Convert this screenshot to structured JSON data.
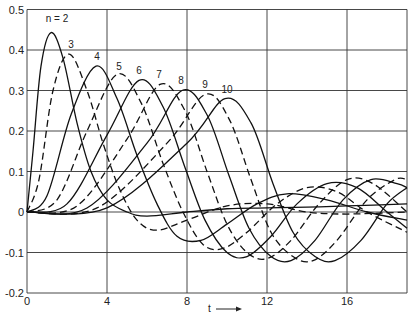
{
  "chart_data": {
    "type": "line",
    "title": "",
    "xlabel": "t",
    "ylabel": "",
    "xlim": [
      0,
      19
    ],
    "ylim": [
      -0.2,
      0.5
    ],
    "x_ticks": [
      "0",
      "4",
      "8",
      "12",
      "16"
    ],
    "y_ticks": [
      "0.5",
      "0.4",
      "0.3",
      "0.2",
      "0.1",
      "0",
      "-0.1",
      "-0.2"
    ],
    "grid": true,
    "legend_position": "inline labels above peaks",
    "series": [
      {
        "name": "n = 2",
        "label": "n = 2",
        "dash": false,
        "points": [
          [
            0,
            0
          ],
          [
            0.3,
            0.15
          ],
          [
            0.7,
            0.36
          ],
          [
            1.2,
            0.443
          ],
          [
            1.8,
            0.38
          ],
          [
            2.5,
            0.22
          ],
          [
            3.2,
            0.1
          ],
          [
            4,
            0.03
          ],
          [
            5,
            0.0
          ],
          [
            6,
            -0.01
          ],
          [
            8,
            0.0
          ],
          [
            10,
            0.008
          ],
          [
            12,
            0.01
          ],
          [
            14,
            0.012
          ],
          [
            16,
            0.015
          ],
          [
            19,
            0.02
          ]
        ]
      },
      {
        "name": "n = 3",
        "label": "3",
        "dash": true,
        "points": [
          [
            0,
            0
          ],
          [
            0.6,
            0.08
          ],
          [
            1.3,
            0.3
          ],
          [
            2.1,
            0.39
          ],
          [
            3,
            0.3
          ],
          [
            3.8,
            0.17
          ],
          [
            4.6,
            0.06
          ],
          [
            5.5,
            -0.02
          ],
          [
            6.5,
            -0.045
          ],
          [
            8,
            -0.02
          ],
          [
            10,
            0.015
          ],
          [
            12,
            0.02
          ],
          [
            14,
            0.0
          ],
          [
            16,
            -0.005
          ],
          [
            19,
            0.0
          ]
        ]
      },
      {
        "name": "n = 4",
        "label": "4",
        "dash": false,
        "points": [
          [
            0,
            0
          ],
          [
            1,
            0.04
          ],
          [
            2.2,
            0.24
          ],
          [
            3.45,
            0.36
          ],
          [
            4.5,
            0.28
          ],
          [
            5.5,
            0.14
          ],
          [
            6.5,
            0.02
          ],
          [
            7.5,
            -0.06
          ],
          [
            8.7,
            -0.07
          ],
          [
            10,
            -0.03
          ],
          [
            11.5,
            0.02
          ],
          [
            13,
            0.045
          ],
          [
            15,
            0.03
          ],
          [
            17,
            0.0
          ],
          [
            19,
            -0.02
          ]
        ]
      },
      {
        "name": "n = 5",
        "label": "5",
        "dash": true,
        "points": [
          [
            0,
            0
          ],
          [
            1.5,
            0.03
          ],
          [
            3,
            0.2
          ],
          [
            4.5,
            0.34
          ],
          [
            5.7,
            0.27
          ],
          [
            6.8,
            0.12
          ],
          [
            7.8,
            0.0
          ],
          [
            8.8,
            -0.08
          ],
          [
            9.8,
            -0.09
          ],
          [
            11,
            -0.05
          ],
          [
            12.5,
            0.02
          ],
          [
            14,
            0.06
          ],
          [
            15.5,
            0.05
          ],
          [
            17,
            0.0
          ],
          [
            19,
            -0.05
          ]
        ]
      },
      {
        "name": "n = 6",
        "label": "6",
        "dash": false,
        "points": [
          [
            0,
            0
          ],
          [
            2,
            0.02
          ],
          [
            4,
            0.19
          ],
          [
            5.6,
            0.325
          ],
          [
            6.8,
            0.26
          ],
          [
            7.9,
            0.11
          ],
          [
            8.9,
            -0.02
          ],
          [
            10,
            -0.1
          ],
          [
            11,
            -0.11
          ],
          [
            12.2,
            -0.06
          ],
          [
            13.5,
            0.02
          ],
          [
            15,
            0.07
          ],
          [
            16.5,
            0.06
          ],
          [
            18,
            0.0
          ],
          [
            19,
            -0.04
          ]
        ]
      },
      {
        "name": "n = 7",
        "label": "7",
        "dash": true,
        "points": [
          [
            0,
            0
          ],
          [
            2.5,
            0.015
          ],
          [
            5,
            0.18
          ],
          [
            6.65,
            0.315
          ],
          [
            7.9,
            0.25
          ],
          [
            9,
            0.1
          ],
          [
            10,
            -0.03
          ],
          [
            11,
            -0.1
          ],
          [
            12,
            -0.115
          ],
          [
            13.2,
            -0.07
          ],
          [
            14.6,
            0.02
          ],
          [
            16,
            0.08
          ],
          [
            17.3,
            0.07
          ],
          [
            19,
            0.0
          ]
        ]
      },
      {
        "name": "n = 8",
        "label": "8",
        "dash": false,
        "points": [
          [
            0,
            0
          ],
          [
            3,
            0.01
          ],
          [
            6,
            0.17
          ],
          [
            7.75,
            0.3
          ],
          [
            9,
            0.24
          ],
          [
            10.1,
            0.09
          ],
          [
            11.1,
            -0.04
          ],
          [
            12.2,
            -0.11
          ],
          [
            13.2,
            -0.12
          ],
          [
            14.4,
            -0.07
          ],
          [
            15.8,
            0.03
          ],
          [
            17.2,
            0.08
          ],
          [
            18.5,
            0.07
          ],
          [
            19,
            0.06
          ]
        ]
      },
      {
        "name": "n = 9",
        "label": "9",
        "dash": true,
        "points": [
          [
            0,
            0
          ],
          [
            3.5,
            0.01
          ],
          [
            7,
            0.17
          ],
          [
            8.9,
            0.29
          ],
          [
            10.1,
            0.23
          ],
          [
            11.2,
            0.08
          ],
          [
            12.2,
            -0.05
          ],
          [
            13.3,
            -0.11
          ],
          [
            14.3,
            -0.12
          ],
          [
            15.5,
            -0.07
          ],
          [
            17,
            0.03
          ],
          [
            18.4,
            0.08
          ],
          [
            19,
            0.08
          ]
        ]
      },
      {
        "name": "n = 10",
        "label": "10",
        "dash": false,
        "points": [
          [
            0,
            0
          ],
          [
            4,
            0.01
          ],
          [
            8,
            0.17
          ],
          [
            9.9,
            0.28
          ],
          [
            11.2,
            0.22
          ],
          [
            12.3,
            0.07
          ],
          [
            13.3,
            -0.05
          ],
          [
            14.4,
            -0.11
          ],
          [
            15.4,
            -0.12
          ],
          [
            16.7,
            -0.07
          ],
          [
            18,
            0.02
          ],
          [
            19,
            0.06
          ]
        ]
      }
    ],
    "label_positions": [
      [
        1.5,
        0.47
      ],
      [
        2.2,
        0.405
      ],
      [
        3.5,
        0.375
      ],
      [
        4.6,
        0.35
      ],
      [
        5.6,
        0.34
      ],
      [
        6.6,
        0.33
      ],
      [
        7.7,
        0.315
      ],
      [
        8.9,
        0.305
      ],
      [
        10,
        0.295
      ]
    ]
  }
}
